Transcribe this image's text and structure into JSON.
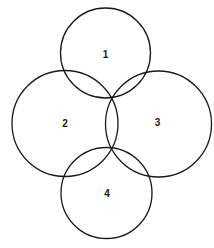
{
  "diagram": {
    "type": "four-circle-overlap",
    "stroke_color": "#1a1a1a",
    "background": "#ffffff",
    "circles": [
      {
        "label": "1",
        "cx": 105.5,
        "cy": 53,
        "r": 45
      },
      {
        "label": "2",
        "cx": 65,
        "cy": 123.5,
        "r": 53
      },
      {
        "label": "3",
        "cx": 158.5,
        "cy": 124,
        "r": 53
      },
      {
        "label": "4",
        "cx": 106.5,
        "cy": 193,
        "r": 45.5
      }
    ],
    "labels": [
      {
        "text": "1",
        "x": 105.5,
        "y": 54
      },
      {
        "text": "2",
        "x": 65,
        "y": 123
      },
      {
        "text": "3",
        "x": 157.5,
        "y": 122
      },
      {
        "text": "4",
        "x": 107,
        "y": 193
      }
    ]
  }
}
